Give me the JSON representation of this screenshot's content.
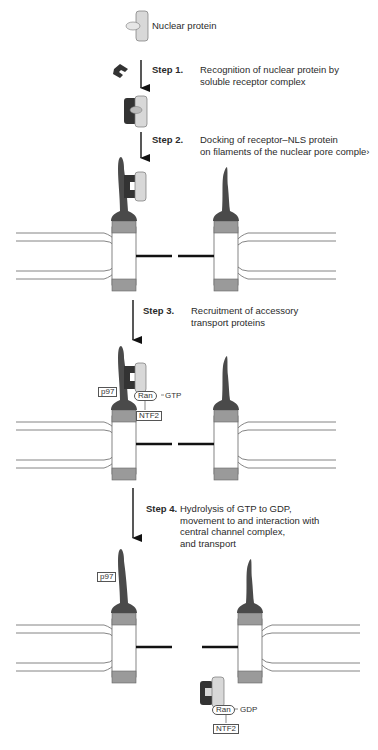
{
  "figure": {
    "colors": {
      "filament": "#4a4a4a",
      "receptor": "#3a3a3a",
      "nuclear_protein": "#d8d8d8",
      "pore_ring": "#9a9a9a",
      "membrane_line": "#777777",
      "channel_bar": "#111111"
    },
    "labels": {
      "nuclear_protein": "Nuclear protein",
      "nls": "NLS"
    },
    "steps": [
      {
        "number": "Step 1.",
        "lines": [
          "Recognition of nuclear protein by",
          "soluble receptor complex"
        ]
      },
      {
        "number": "Step 2.",
        "lines": [
          "Docking of receptor–NLS protein",
          "on filaments of the nuclear pore comple›"
        ]
      },
      {
        "number": "Step 3.",
        "lines": [
          "Recruitment of accessory",
          "transport proteins"
        ]
      },
      {
        "number": "Step 4.",
        "lines": [
          "Hydrolysis of GTP to GDP,",
          "movement to and interaction with",
          "central channel complex,",
          "and transport"
        ]
      }
    ],
    "step3_tags": {
      "p97": "p97",
      "ran": "Ran",
      "gtp": "GTP",
      "ntf2": "NTF2"
    },
    "step4_tags": {
      "p97": "p97",
      "ran": "Ran",
      "gdp": "GDP",
      "ntf2": "NTF2"
    }
  }
}
